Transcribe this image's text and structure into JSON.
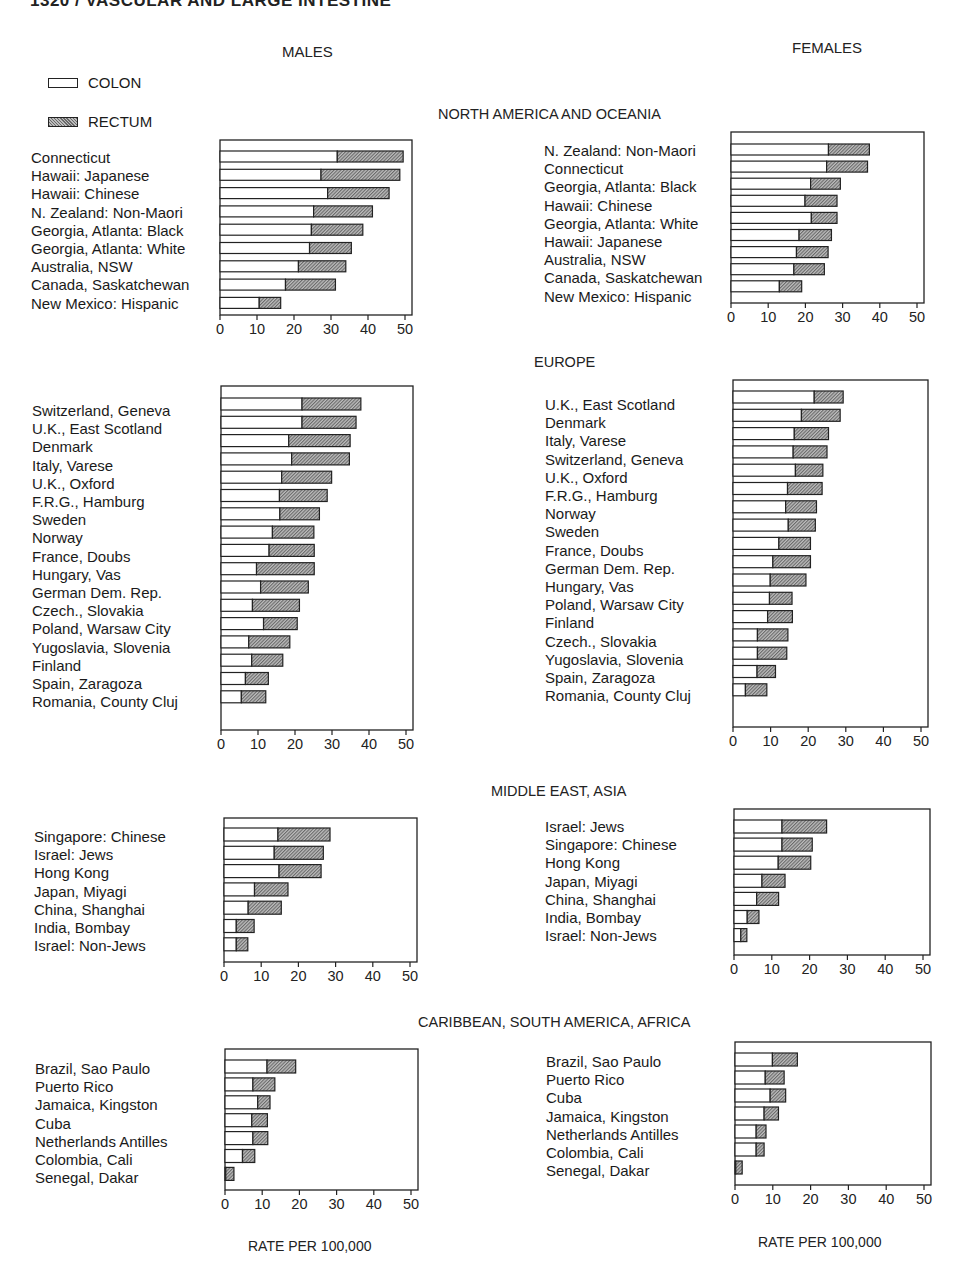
{
  "page": {
    "running_head": "1320 / VASCULAR AND LARGE INTESTINE",
    "males_title": "MALES",
    "females_title": "FEMALES",
    "x_axis_title": "RATE PER 100,000"
  },
  "legend": {
    "items": [
      {
        "label": "COLON",
        "pattern": "white"
      },
      {
        "label": "RECTUM",
        "pattern": "hatched"
      }
    ]
  },
  "sections": [
    {
      "title": "NORTH AMERICA AND OCEANIA"
    },
    {
      "title": "EUROPE"
    },
    {
      "title": "MIDDLE EAST, ASIA"
    },
    {
      "title": "CARIBBEAN, SOUTH AMERICA, AFRICA"
    }
  ],
  "colors": {
    "colon_fill": "#ffffff",
    "rectum_dark": "#6a6a6a",
    "rectum_light": "#bdbdbd",
    "stroke": "#222222"
  },
  "chart_data": [
    {
      "type": "bar",
      "orientation": "horizontal",
      "stacked": true,
      "title": "NORTH AMERICA AND OCEANIA",
      "panel": "MALES",
      "xlabel": "RATE PER 100,000",
      "xlim": [
        0,
        50
      ],
      "xticks": [
        0,
        10,
        20,
        30,
        40,
        50
      ],
      "legend": [
        "COLON",
        "RECTUM"
      ],
      "categories": [
        "Connecticut",
        "Hawaii: Japanese",
        "Hawaii: Chinese",
        "N. Zealand: Non-Maori",
        "Georgia, Atlanta: Black",
        "Georgia, Atlanta: White",
        "Australia, NSW",
        "Canada, Saskatchewan",
        "New Mexico: Hispanic"
      ],
      "series": [
        {
          "name": "COLON",
          "values": [
            31.7,
            27.3,
            29.1,
            25.3,
            24.7,
            24.2,
            21.2,
            17.7,
            10.6
          ]
        },
        {
          "name": "RECTUM",
          "values": [
            17.8,
            21.3,
            16.6,
            15.9,
            13.9,
            11.3,
            12.8,
            13.5,
            5.8
          ]
        }
      ],
      "layout": {
        "box": [
          220,
          140,
          412,
          315
        ],
        "first_bar_y": 151,
        "pitch": 18.3,
        "bar_h": 11
      }
    },
    {
      "type": "bar",
      "orientation": "horizontal",
      "stacked": true,
      "title": "NORTH AMERICA AND OCEANIA",
      "panel": "FEMALES",
      "xlabel": "RATE PER 100,000",
      "xlim": [
        0,
        50
      ],
      "xticks": [
        0,
        10,
        20,
        30,
        40,
        50
      ],
      "legend": [
        "COLON",
        "RECTUM"
      ],
      "categories": [
        "N. Zealand: Non-Maori",
        "Connecticut",
        "Georgia, Atlanta: Black",
        "Hawaii: Chinese",
        "Georgia, Atlanta: White",
        "Hawaii: Japanese",
        "Australia, NSW",
        "Canada, Saskatchewan",
        "New Mexico: Hispanic"
      ],
      "series": [
        {
          "name": "COLON",
          "values": [
            26.2,
            25.7,
            21.4,
            19.9,
            21.6,
            18.3,
            17.6,
            16.9,
            13.0
          ]
        },
        {
          "name": "RECTUM",
          "values": [
            11.0,
            11.0,
            8.0,
            8.6,
            6.9,
            8.7,
            8.5,
            8.2,
            6.0
          ]
        }
      ],
      "layout": {
        "box": [
          731,
          132,
          924,
          303
        ],
        "first_bar_y": 144,
        "pitch": 17.1,
        "bar_h": 11
      }
    },
    {
      "type": "bar",
      "orientation": "horizontal",
      "stacked": true,
      "title": "EUROPE",
      "panel": "MALES",
      "xlabel": "RATE PER 100,000",
      "xlim": [
        0,
        50
      ],
      "xticks": [
        0,
        10,
        20,
        30,
        40,
        50
      ],
      "legend": [
        "COLON",
        "RECTUM"
      ],
      "categories": [
        "Switzerland, Geneva",
        "U.K., East Scotland",
        "Denmark",
        "Italy, Varese",
        "U.K., Oxford",
        "F.R.G., Hamburg",
        "Sweden",
        "Norway",
        "France, Doubs",
        "Hungary, Vas",
        "German Dem. Rep.",
        "Czech., Slovakia",
        "Poland, Warsaw City",
        "Yugoslavia, Slovenia",
        "Finland",
        "Spain, Zaragoza",
        "Romania, County Cluj"
      ],
      "series": [
        {
          "name": "COLON",
          "values": [
            21.9,
            21.9,
            18.3,
            19.1,
            16.4,
            15.8,
            15.9,
            13.9,
            13.0,
            9.6,
            10.7,
            8.5,
            11.5,
            7.5,
            8.3,
            6.6,
            5.5
          ]
        },
        {
          "name": "RECTUM",
          "values": [
            15.9,
            14.6,
            16.6,
            15.6,
            13.5,
            12.9,
            10.7,
            11.2,
            12.2,
            15.6,
            12.9,
            12.7,
            9.1,
            11.1,
            8.4,
            6.2,
            6.6
          ]
        }
      ],
      "layout": {
        "box": [
          221,
          386,
          413,
          730
        ],
        "first_bar_y": 398,
        "pitch": 18.3,
        "bar_h": 12
      }
    },
    {
      "type": "bar",
      "orientation": "horizontal",
      "stacked": true,
      "title": "EUROPE",
      "panel": "FEMALES",
      "xlabel": "RATE PER 100,000",
      "xlim": [
        0,
        50
      ],
      "xticks": [
        0,
        10,
        20,
        30,
        40,
        50
      ],
      "legend": [
        "COLON",
        "RECTUM"
      ],
      "categories": [
        "U.K., East Scotland",
        "Denmark",
        "Italy, Varese",
        "Switzerland, Geneva",
        "U.K., Oxford",
        "F.R.G., Hamburg",
        "Norway",
        "Sweden",
        "France, Doubs",
        "German Dem. Rep.",
        "Hungary, Vas",
        "Poland, Warsaw City",
        "Finland",
        "Czech., Slovakia",
        "Yugoslavia, Slovenia",
        "Spain, Zaragoza",
        "Romania, County Cluj"
      ],
      "series": [
        {
          "name": "COLON",
          "values": [
            21.6,
            18.2,
            16.3,
            16.0,
            16.6,
            14.5,
            14.0,
            14.7,
            12.2,
            10.6,
            9.9,
            9.7,
            9.2,
            6.5,
            6.5,
            6.4,
            3.3
          ]
        },
        {
          "name": "RECTUM",
          "values": [
            7.7,
            10.3,
            9.1,
            9.0,
            7.3,
            9.2,
            8.2,
            7.2,
            8.4,
            10.0,
            9.5,
            6.0,
            6.6,
            8.1,
            7.8,
            4.9,
            5.7
          ]
        }
      ],
      "layout": {
        "box": [
          733,
          380,
          928,
          727
        ],
        "first_bar_y": 391,
        "pitch": 18.3,
        "bar_h": 12
      }
    },
    {
      "type": "bar",
      "orientation": "horizontal",
      "stacked": true,
      "title": "MIDDLE EAST, ASIA",
      "panel": "MALES",
      "xlabel": "RATE PER 100,000",
      "xlim": [
        0,
        50
      ],
      "xticks": [
        0,
        10,
        20,
        30,
        40,
        50
      ],
      "legend": [
        "COLON",
        "RECTUM"
      ],
      "categories": [
        "Singapore: Chinese",
        "Israel: Jews",
        "Hong Kong",
        "Japan, Miyagi",
        "China, Shanghai",
        "India, Bombay",
        "Israel: Non-Jews"
      ],
      "series": [
        {
          "name": "COLON",
          "values": [
            14.5,
            13.5,
            14.8,
            8.2,
            6.5,
            3.3,
            3.3
          ]
        },
        {
          "name": "RECTUM",
          "values": [
            14.0,
            13.2,
            11.3,
            9.0,
            8.9,
            4.8,
            3.1
          ]
        }
      ],
      "layout": {
        "box": [
          224,
          818,
          417,
          962
        ],
        "first_bar_y": 828,
        "pitch": 18.3,
        "bar_h": 13
      }
    },
    {
      "type": "bar",
      "orientation": "horizontal",
      "stacked": true,
      "title": "MIDDLE EAST, ASIA",
      "panel": "FEMALES",
      "xlabel": "RATE PER 100,000",
      "xlim": [
        0,
        50
      ],
      "xticks": [
        0,
        10,
        20,
        30,
        40,
        50
      ],
      "legend": [
        "COLON",
        "RECTUM"
      ],
      "categories": [
        "Israel: Jews",
        "Singapore: Chinese",
        "Hong Kong",
        "Japan, Miyagi",
        "China, Shanghai",
        "India, Bombay",
        "Israel: Non-Jews"
      ],
      "series": [
        {
          "name": "COLON",
          "values": [
            12.7,
            12.7,
            11.7,
            7.4,
            6.0,
            3.5,
            1.8
          ]
        },
        {
          "name": "RECTUM",
          "values": [
            11.8,
            8.0,
            8.6,
            6.1,
            5.8,
            3.1,
            1.6
          ]
        }
      ],
      "layout": {
        "box": [
          734,
          809,
          930,
          955
        ],
        "first_bar_y": 820,
        "pitch": 18.1,
        "bar_h": 13
      }
    },
    {
      "type": "bar",
      "orientation": "horizontal",
      "stacked": true,
      "title": "CARIBBEAN, SOUTH AMERICA, AFRICA",
      "panel": "MALES",
      "xlabel": "RATE PER 100,000",
      "xlim": [
        0,
        50
      ],
      "xticks": [
        0,
        10,
        20,
        30,
        40,
        50
      ],
      "legend": [
        "COLON",
        "RECTUM"
      ],
      "categories": [
        "Brazil, Sao Paulo",
        "Puerto Rico",
        "Jamaica, Kingston",
        "Cuba",
        "Netherlands Antilles",
        "Colombia, Cali",
        "Senegal, Dakar"
      ],
      "series": [
        {
          "name": "COLON",
          "values": [
            11.3,
            7.5,
            8.8,
            7.2,
            7.5,
            4.7,
            0.2
          ]
        },
        {
          "name": "RECTUM",
          "values": [
            7.7,
            5.9,
            3.3,
            4.2,
            4.0,
            3.3,
            2.2
          ]
        }
      ],
      "layout": {
        "box": [
          225,
          1049,
          418,
          1190
        ],
        "first_bar_y": 1060,
        "pitch": 17.9,
        "bar_h": 13
      }
    },
    {
      "type": "bar",
      "orientation": "horizontal",
      "stacked": true,
      "title": "CARIBBEAN, SOUTH AMERICA, AFRICA",
      "panel": "FEMALES",
      "xlabel": "RATE PER 100,000",
      "xlim": [
        0,
        50
      ],
      "xticks": [
        0,
        10,
        20,
        30,
        40,
        50
      ],
      "legend": [
        "COLON",
        "RECTUM"
      ],
      "categories": [
        "Brazil, Sao Paulo",
        "Puerto Rico",
        "Cuba",
        "Jamaica, Kingston",
        "Netherlands Antilles",
        "Colombia, Cali",
        "Senegal, Dakar"
      ],
      "series": [
        {
          "name": "COLON",
          "values": [
            9.9,
            8.0,
            9.3,
            7.7,
            5.6,
            5.6,
            0.2
          ]
        },
        {
          "name": "RECTUM",
          "values": [
            6.6,
            5.0,
            4.1,
            3.8,
            2.6,
            2.1,
            1.7
          ]
        }
      ],
      "layout": {
        "box": [
          735,
          1042,
          931,
          1185
        ],
        "first_bar_y": 1053,
        "pitch": 18.0,
        "bar_h": 13
      }
    }
  ],
  "label_positions": [
    {
      "x": 31,
      "y": 149
    },
    {
      "x": 544,
      "y": 142
    },
    {
      "x": 32,
      "y": 402
    },
    {
      "x": 545,
      "y": 396
    },
    {
      "x": 34,
      "y": 828
    },
    {
      "x": 545,
      "y": 818
    },
    {
      "x": 35,
      "y": 1060
    },
    {
      "x": 546,
      "y": 1053
    }
  ]
}
